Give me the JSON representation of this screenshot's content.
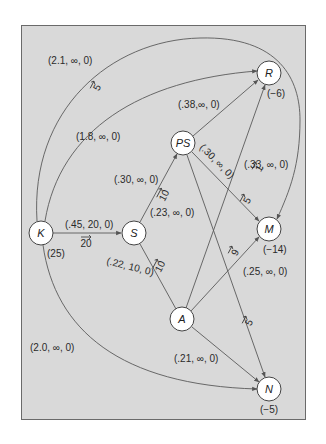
{
  "nodes": [
    {
      "id": "K",
      "label": "K",
      "supply": "(25)"
    },
    {
      "id": "S",
      "label": "S",
      "supply": ""
    },
    {
      "id": "PS",
      "label": "PS",
      "supply": ""
    },
    {
      "id": "R",
      "label": "R",
      "supply": "(−6)"
    },
    {
      "id": "M",
      "label": "M",
      "supply": "(−14)"
    },
    {
      "id": "A",
      "label": "A",
      "supply": ""
    },
    {
      "id": "N",
      "label": "N",
      "supply": "(−5)"
    }
  ],
  "edges": {
    "K_R": {
      "params": "(1.8, ∞, 0)",
      "flow": "5"
    },
    "K_M": {
      "params": "(2.1, ∞, 0)",
      "flow": ""
    },
    "K_S": {
      "params": "(.45, 20, 0)",
      "flow": "20"
    },
    "K_N": {
      "params": "(2.0, ∞, 0)",
      "flow": ""
    },
    "S_PS": {
      "params": "(.30, ∞, 0)",
      "flow": "10"
    },
    "S_A": {
      "params": "(.22, 10, 0)",
      "flow": "10"
    },
    "PS_R": {
      "params": "(.38,∞, 0)",
      "flow": ""
    },
    "PS_M": {
      "params": "(.30, ∞, 0)",
      "flow": "5"
    },
    "PS_N": {
      "params": "(.23, ∞, 0)",
      "flow": "5"
    },
    "A_R": {
      "params": "(.33, ∞, 0)",
      "flow": "1"
    },
    "A_M": {
      "params": "(.25, ∞, 0)",
      "flow": "9"
    },
    "A_N": {
      "params": "(.21, ∞, 0)",
      "flow": ""
    }
  },
  "colors": {
    "background": "#d9d9d9",
    "frame_border": "#6a6a6a",
    "node_fill": "#ffffff"
  }
}
